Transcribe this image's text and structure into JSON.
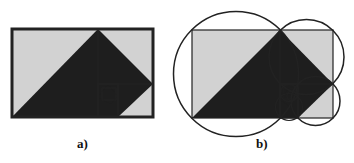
{
  "figure": {
    "panels": [
      {
        "id": "a",
        "caption": "a)",
        "description": "Golden rectangle subdivided into squares with dark triangles forming a spiral"
      },
      {
        "id": "b",
        "caption": "b)",
        "description": "Same golden rectangle construction with circumscribed circles around each square"
      }
    ]
  },
  "colors": {
    "fill_light": "#d2d2d2",
    "fill_dark": "#1e1e1e",
    "stroke": "#222222",
    "background": "#ffffff"
  }
}
